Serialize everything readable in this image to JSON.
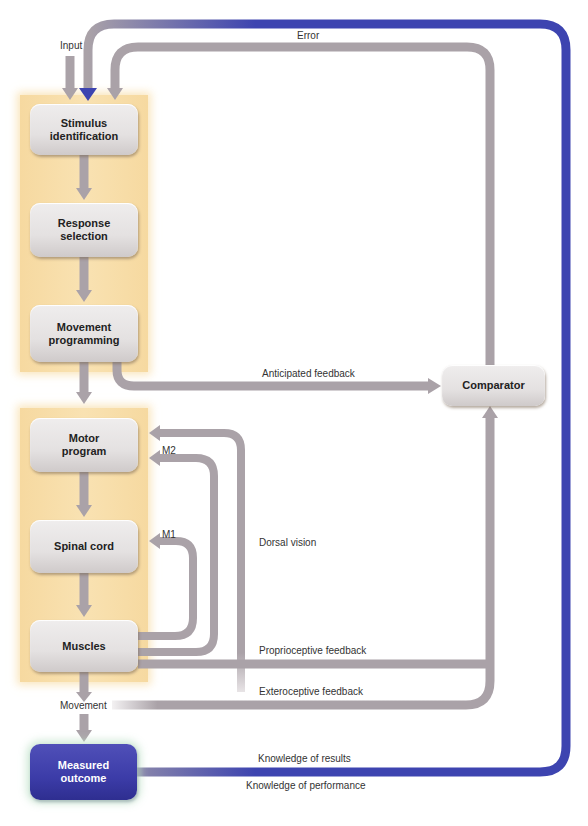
{
  "diagram": {
    "colors": {
      "gray_arrow": "#aaa2a8",
      "blue_arrow": "#3d44b0",
      "panel": "#f8dfab",
      "box": "#e6e3e3"
    },
    "boxes": {
      "stimulus": "Stimulus identification",
      "stimulus_l1": "Stimulus",
      "stimulus_l2": "identification",
      "response_l1": "Response",
      "response_l2": "selection",
      "programming_l1": "Movement",
      "programming_l2": "programming",
      "motor_l1": "Motor",
      "motor_l2": "program",
      "spinal": "Spinal cord",
      "muscles": "Muscles",
      "outcome_l1": "Measured",
      "outcome_l2": "outcome",
      "comparator": "Comparator"
    },
    "labels": {
      "input": "Input",
      "error": "Error",
      "anticipated": "Anticipated feedback",
      "m2": "M2",
      "m1": "M1",
      "dorsal": "Dorsal vision",
      "proprioceptive": "Proprioceptive feedback",
      "exteroceptive": "Exteroceptive feedback",
      "movement": "Movement",
      "kr": "Knowledge of results",
      "kp": "Knowledge of performance"
    }
  }
}
